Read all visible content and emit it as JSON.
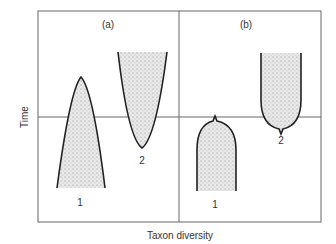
{
  "figure": {
    "y_axis_label": "Time",
    "x_axis_label": "Taxon diversity",
    "panels": [
      {
        "id": "a",
        "label": "(a)",
        "shapes": [
          {
            "label": "1",
            "form": "spindle narrowing upward to apex"
          },
          {
            "label": "2",
            "form": "spindle narrowing downward to apex"
          }
        ]
      },
      {
        "id": "b",
        "label": "(b)",
        "shapes": [
          {
            "label": "1",
            "form": "column with rounded, pointed top at boundary"
          },
          {
            "label": "2",
            "form": "column with rounded, pointed bottom at boundary"
          }
        ]
      }
    ]
  },
  "colors": {
    "frame": "#555555",
    "outline": "#222222",
    "fill": "#d8d8d8"
  }
}
